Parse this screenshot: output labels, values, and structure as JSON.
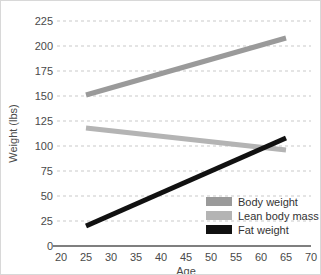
{
  "chart_data": {
    "type": "line",
    "title": "",
    "xlabel": "Age",
    "ylabel": "Weight (lbs)",
    "xlim": [
      20,
      70
    ],
    "ylim": [
      0,
      225
    ],
    "xticks": [
      20,
      25,
      30,
      35,
      40,
      45,
      50,
      55,
      60,
      65,
      70
    ],
    "yticks": [
      0,
      25,
      50,
      75,
      100,
      125,
      150,
      175,
      200,
      225
    ],
    "grid": "horizontal-dashed",
    "legend_position": "lower-right",
    "x": [
      25,
      65
    ],
    "series": [
      {
        "name": "Body weight",
        "color": "#9a9a9a",
        "values": [
          151,
          208
        ]
      },
      {
        "name": "Lean body mass",
        "color": "#b4b4b4",
        "values": [
          118,
          96
        ]
      },
      {
        "name": "Fat weight",
        "color": "#111111",
        "values": [
          20,
          108
        ]
      }
    ],
    "annotations": []
  },
  "axes": {
    "x_tick_labels": [
      "20",
      "25",
      "30",
      "35",
      "40",
      "45",
      "50",
      "55",
      "60",
      "65",
      "70"
    ],
    "y_tick_labels": [
      "0",
      "25",
      "50",
      "75",
      "100",
      "125",
      "150",
      "175",
      "200",
      "225"
    ],
    "x_title": "Age",
    "y_title": "Weight (lbs)"
  },
  "legend": {
    "items": [
      {
        "label": "Body weight",
        "color": "#9a9a9a"
      },
      {
        "label": "Lean body mass",
        "color": "#b4b4b4"
      },
      {
        "label": "Fat weight",
        "color": "#111111"
      }
    ]
  },
  "colors": {
    "background": "#ffffff",
    "grid": "#c9c9c9",
    "axis": "#555555",
    "text": "#4a4a4a"
  }
}
